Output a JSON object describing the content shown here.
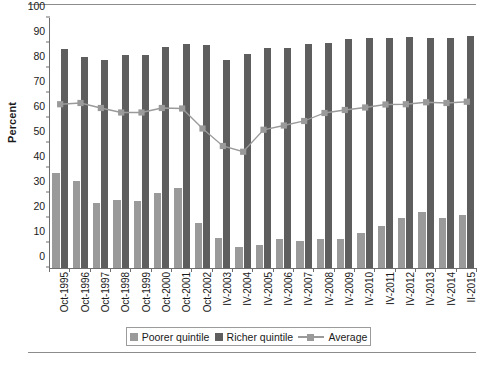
{
  "chart_data": {
    "type": "bar",
    "title": "",
    "xlabel": "",
    "ylabel": "Percent",
    "ylim": [
      0,
      100
    ],
    "yticks": [
      0,
      10,
      20,
      30,
      40,
      50,
      60,
      70,
      80,
      90,
      100
    ],
    "grid": false,
    "legend_position": "bottom",
    "categories": [
      "Oct-1995",
      "Oct-1996",
      "Oct-1997",
      "Oct-1998",
      "Oct-1999",
      "Oct-2000",
      "Oct-2001",
      "Oct-2002",
      "IV-2003",
      "IV-2004",
      "IV-2005",
      "IV-2006",
      "IV-2007",
      "IV-2008",
      "IV-2009",
      "IV-2010",
      "IV-2011",
      "IV-2012",
      "IV-2013",
      "IV-2014",
      "II-2015"
    ],
    "series": [
      {
        "name": "Poorer quintile",
        "type": "bar",
        "color": "#9a9a9a",
        "values": [
          38.0,
          35.0,
          26.0,
          27.3,
          26.7,
          30.0,
          32.0,
          18.2,
          12.0,
          8.5,
          9.3,
          11.7,
          11.0,
          11.8,
          11.8,
          14.2,
          16.8,
          20.1,
          22.6,
          20.2,
          21.1
        ]
      },
      {
        "name": "Richer quintile",
        "type": "bar",
        "color": "#5e5e5e",
        "values": [
          87.5,
          84.5,
          83.4,
          85.2,
          85.4,
          88.3,
          89.6,
          89.2,
          83.3,
          85.5,
          88.2,
          88.0,
          89.6,
          90.2,
          91.8,
          92.0,
          91.9,
          92.6,
          92.0,
          92.0,
          92.7
        ]
      },
      {
        "name": "Average",
        "type": "line",
        "color": "#9a9a9a",
        "values": [
          65.5,
          66.0,
          64.0,
          62.2,
          62.2,
          64.0,
          63.8,
          55.8,
          48.8,
          46.5,
          55.3,
          57.0,
          58.8,
          62.0,
          63.2,
          64.2,
          65.4,
          65.5,
          66.3,
          66.0,
          66.5
        ]
      }
    ]
  },
  "legend": {
    "items": [
      {
        "label": "Poorer quintile",
        "marker": "square-swatch"
      },
      {
        "label": "Richer quintile",
        "marker": "square-swatch"
      },
      {
        "label": "Average",
        "marker": "line-marker"
      }
    ]
  },
  "colors": {
    "poorer": "#9a9a9a",
    "richer": "#5e5e5e",
    "average": "#9a9a9a",
    "axis": "#6f6f6f",
    "rule": "#8c8c8c"
  }
}
